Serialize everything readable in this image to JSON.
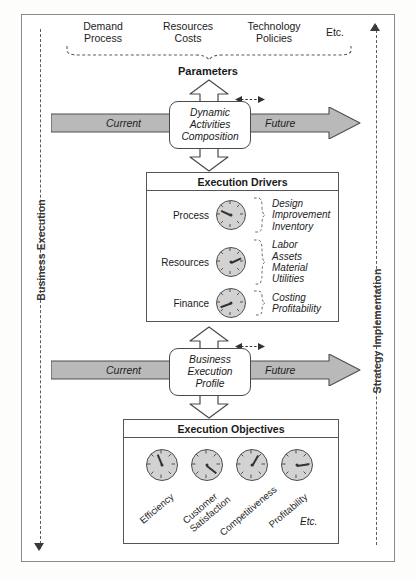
{
  "diagram": {
    "left_axis": {
      "label": "Business Execution",
      "direction": "down"
    },
    "right_axis": {
      "label": "Strategy Implementation",
      "direction": "up"
    },
    "parameters": {
      "title": "Parameters",
      "groups": [
        {
          "lines": [
            "Demand",
            "Process"
          ]
        },
        {
          "lines": [
            "Resources",
            "Costs"
          ]
        },
        {
          "lines": [
            "Technology",
            "Policies"
          ]
        },
        {
          "lines": [
            "Etc."
          ]
        }
      ]
    },
    "band_top": {
      "left_label": "Current",
      "right_label": "Future",
      "center_box": [
        "Dynamic",
        "Activities",
        "Composition"
      ]
    },
    "band_bottom": {
      "left_label": "Current",
      "right_label": "Future",
      "center_box": [
        "Business",
        "Execution",
        "Profile"
      ]
    },
    "drivers": {
      "title": "Execution Drivers",
      "rows": [
        {
          "name": "Process",
          "items": [
            "Design",
            "Improvement",
            "Inventory"
          ],
          "needle": 205
        },
        {
          "name": "Resources",
          "items": [
            "Labor",
            "Assets",
            "Material",
            "Utilities"
          ],
          "needle": 335
        },
        {
          "name": "Finance",
          "items": [
            "Costing",
            "Profitability"
          ],
          "needle": 160
        }
      ]
    },
    "objectives": {
      "title": "Execution Objectives",
      "items": [
        {
          "label": "Efficiency",
          "lines": [
            "Efficiency"
          ],
          "needle": 248
        },
        {
          "label": "Customer Satisfaction",
          "lines": [
            "Customer",
            "Satisfaction"
          ],
          "needle": 38
        },
        {
          "label": "Competitiveness",
          "lines": [
            "Competitiveness"
          ],
          "needle": 300
        },
        {
          "label": "Profitability",
          "lines": [
            "Profitability"
          ],
          "needle": 352
        }
      ],
      "etc": "Etc."
    },
    "colors": {
      "band_fill": "#b9b9b9",
      "gauge_fill": "#d2d2d2",
      "stroke": "#4f4f4f",
      "frame": "#8a8a8a"
    }
  }
}
